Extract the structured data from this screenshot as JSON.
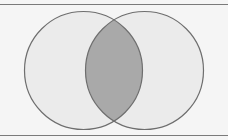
{
  "diagram": {
    "type": "venn",
    "background": "#f5f5f5",
    "border_color": "#7a7a7a",
    "circle_fill": "#ebebeb",
    "circle_stroke": "#6e6e6e",
    "intersection_fill": "#a9a9a9",
    "sets": [
      {
        "name": "left-set",
        "cx": 83.5,
        "cy": 70.5,
        "r": 59
      },
      {
        "name": "right-set",
        "cx": 144.5,
        "cy": 70.5,
        "r": 59
      }
    ],
    "intersection": {
      "name": "intersection",
      "highlighted": true
    }
  }
}
